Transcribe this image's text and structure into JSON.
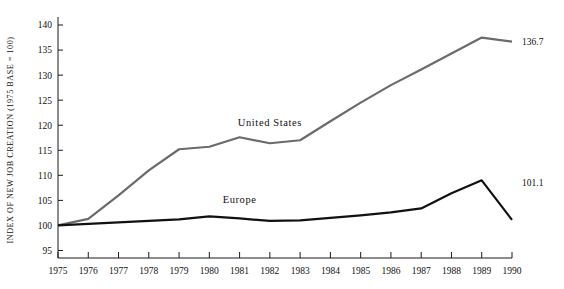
{
  "chart_data": {
    "type": "line",
    "title": "",
    "xlabel": "",
    "ylabel": "INDEX OF NEW JOB CREATION (1975 BASE = 100)",
    "x": [
      1975,
      1976,
      1977,
      1978,
      1979,
      1980,
      1981,
      1982,
      1983,
      1984,
      1985,
      1986,
      1987,
      1988,
      1989,
      1990
    ],
    "categories": [
      "1975",
      "1976",
      "1977",
      "1978",
      "1979",
      "1980",
      "1981",
      "1982",
      "1983",
      "1984",
      "1985",
      "1986",
      "1987",
      "1988",
      "1989",
      "1990"
    ],
    "xlim": [
      1975,
      1990
    ],
    "ylim": [
      93.5,
      141
    ],
    "yticks": [
      95,
      100,
      105,
      110,
      115,
      120,
      125,
      130,
      135,
      140
    ],
    "ytick_labels": [
      "95",
      "100",
      "105",
      "110",
      "115",
      "120",
      "125",
      "130",
      "135",
      "140"
    ],
    "grid": false,
    "legend_position": "inline-annotations",
    "series": [
      {
        "name": "United States",
        "color": "#6b6b6b",
        "width": 2.2,
        "values": [
          100.0,
          101.3,
          106.0,
          111.0,
          115.2,
          115.7,
          117.6,
          116.4,
          117.0,
          120.8,
          124.5,
          128.0,
          131.1,
          134.3,
          137.5,
          136.7
        ],
        "label": "United States",
        "label_x": 1982,
        "label_y": 119.8,
        "end_label": "136.7"
      },
      {
        "name": "Europe",
        "color": "#111111",
        "width": 2.2,
        "values": [
          100.0,
          100.3,
          100.6,
          100.9,
          101.2,
          101.8,
          101.4,
          100.9,
          101.0,
          101.5,
          102.0,
          102.6,
          103.4,
          106.4,
          109.0,
          101.1
        ],
        "label": "Europe",
        "label_x": 1981,
        "label_y": 104.5,
        "end_label": "101.1"
      }
    ]
  }
}
